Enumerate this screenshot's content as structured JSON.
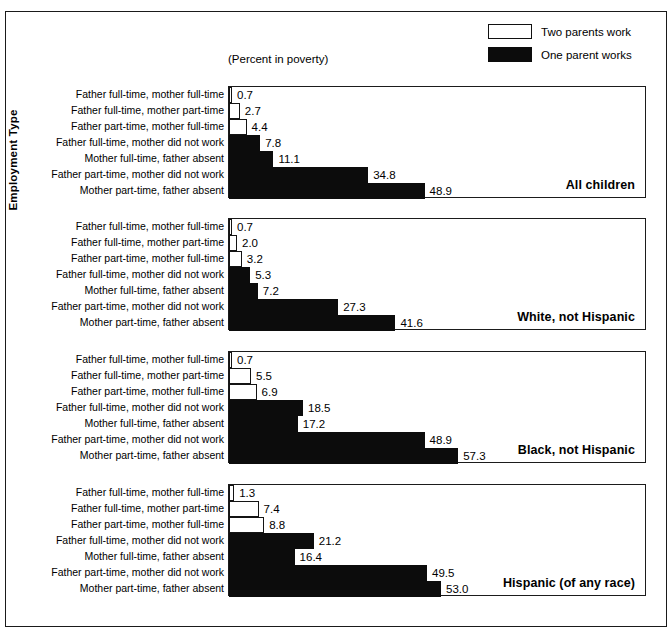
{
  "figure": {
    "y_axis_title": "Employment Type",
    "plot_caption": "(Percent in poverty)"
  },
  "legend": {
    "position": "top-right",
    "items": [
      {
        "label": "Two parents work",
        "swatch": "white-box-icon",
        "color": "#ffffff"
      },
      {
        "label": "One parent works",
        "swatch": "black-box-icon",
        "color": "#0c0c0c"
      }
    ]
  },
  "chart_data": {
    "type": "bar",
    "orientation": "horizontal",
    "title": "",
    "subtitle": "(Percent in poverty)",
    "xlabel": "(Percent in poverty)",
    "ylabel": "Employment Type",
    "xlim": [
      0,
      104
    ],
    "grid": false,
    "legend_position": "top-right",
    "categories": [
      "Father full-time, mother full-time",
      "Father full-time, mother part-time",
      "Father part-time, mother full-time",
      "Father full-time, mother did not work",
      "Mother full-time, father absent",
      "Father part-time, mother did not work",
      "Mother part-time, father absent"
    ],
    "category_groups": [
      "Two parents work",
      "Two parents work",
      "Two parents work",
      "One parent works",
      "One parent works",
      "One parent works",
      "One parent works"
    ],
    "panels": [
      {
        "title": "All children",
        "values": [
          0.7,
          2.7,
          4.4,
          7.8,
          11.1,
          34.8,
          48.9
        ],
        "labels": [
          "0.7",
          "2.7",
          "4.4",
          "7.8",
          "11.1",
          "34.8",
          "48.9"
        ]
      },
      {
        "title": "White, not Hispanic",
        "values": [
          0.7,
          2.0,
          3.2,
          5.3,
          7.2,
          27.3,
          41.6
        ],
        "labels": [
          "0.7",
          "2.0",
          "3.2",
          "5.3",
          "7.2",
          "27.3",
          "41.6"
        ]
      },
      {
        "title": "Black, not Hispanic",
        "values": [
          0.7,
          5.5,
          6.9,
          18.5,
          17.2,
          48.9,
          57.3
        ],
        "labels": [
          "0.7",
          "5.5",
          "6.9",
          "18.5",
          "17.2",
          "48.9",
          "57.3"
        ]
      },
      {
        "title": "Hispanic (of any race)",
        "values": [
          1.3,
          7.4,
          8.8,
          21.2,
          16.4,
          49.5,
          53.0
        ],
        "labels": [
          "1.3",
          "7.4",
          "8.8",
          "21.2",
          "16.4",
          "49.5",
          "53.0"
        ]
      }
    ]
  },
  "layout": {
    "panel_tops": [
      86,
      218,
      351,
      484
    ],
    "panel_height": 112,
    "row_height": 16,
    "px_per_unit": 4.0,
    "bar_left": 228,
    "panel_width": 418
  }
}
